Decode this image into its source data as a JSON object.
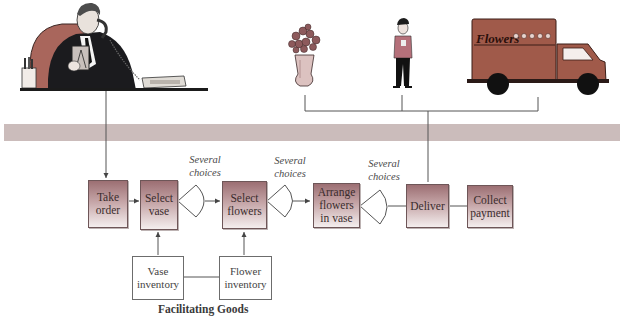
{
  "diagram": {
    "type": "process-flow",
    "theme_colors": {
      "box_gradient_top": "#9c6f73",
      "box_gradient_bottom": "#f4eeee",
      "band": "#cbbcbb",
      "truck": "#a05a4a",
      "chair": "#a9665c",
      "line": "#555555"
    },
    "illustrations": {
      "customer": "man-on-phone-at-desk",
      "vase": "vase-of-flowers",
      "courier": "delivery-person",
      "truck": "delivery-truck",
      "truck_label": "Flowers"
    },
    "process_steps": [
      {
        "id": "take-order",
        "label": "Take order"
      },
      {
        "id": "select-vase",
        "label": "Select vase"
      },
      {
        "id": "select-flowers",
        "label": "Select flowers"
      },
      {
        "id": "arrange",
        "label": "Arrange flowers in vase"
      },
      {
        "id": "deliver",
        "label": "Deliver"
      },
      {
        "id": "collect-payment",
        "label": "Collect payment"
      }
    ],
    "steps_display": {
      "take_order_1": "Take",
      "take_order_2": "order",
      "select_vase_1": "Select",
      "select_vase_2": "vase",
      "select_flowers_1": "Select",
      "select_flowers_2": "flowers",
      "arrange_1": "Arrange",
      "arrange_2": "flowers",
      "arrange_3": "in vase",
      "deliver": "Deliver",
      "collect_1": "Collect",
      "collect_2": "payment"
    },
    "choices": [
      {
        "after": "select-vase",
        "line1": "Several",
        "line2": "choices"
      },
      {
        "after": "select-flowers",
        "line1": "Several",
        "line2": "choices"
      },
      {
        "after": "arrange",
        "line1": "Several",
        "line2": "choices"
      }
    ],
    "inventories": [
      {
        "id": "vase-inventory",
        "line1": "Vase",
        "line2": "inventory",
        "feeds": "select-vase"
      },
      {
        "id": "flower-inventory",
        "line1": "Flower",
        "line2": "inventory",
        "feeds": "select-flowers"
      }
    ],
    "caption": "Facilitating Goods",
    "edges": [
      [
        "customer",
        "take-order"
      ],
      [
        "take-order",
        "select-vase"
      ],
      [
        "select-vase",
        "select-flowers"
      ],
      [
        "select-flowers",
        "arrange"
      ],
      [
        "arrange",
        "deliver"
      ],
      [
        "deliver",
        "collect-payment"
      ],
      [
        "vase-inventory",
        "select-vase"
      ],
      [
        "flower-inventory",
        "select-flowers"
      ],
      [
        "vase-inventory",
        "flower-inventory"
      ],
      [
        "deliver",
        "vase/courier/truck"
      ]
    ]
  }
}
